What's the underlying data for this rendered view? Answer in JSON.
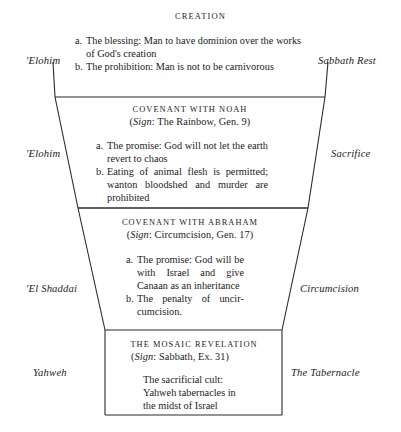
{
  "figure": {
    "title": "CREATION",
    "shape": {
      "stroke_color": "#2b2b2b",
      "description": "nested-trapezoid"
    },
    "sections": [
      {
        "id": "creation",
        "heading": "CREATION",
        "sign": null,
        "left_label": "'Elohim",
        "right_label": "Sabbath Rest",
        "items": [
          {
            "mark": "a.",
            "text": "The blessing: Man to have dominion over the works of God's creation"
          },
          {
            "mark": "b.",
            "text": "The prohibition: Man is not to be carnivorous"
          }
        ]
      },
      {
        "id": "noah",
        "heading": "COVENANT WITH NOAH",
        "sign_prefix": "Sign",
        "sign_rest": ": The Rainbow, Gen. 9)",
        "sign_open": "(",
        "sign_full": "(Sign: The Rainbow, Gen. 9)",
        "left_label": "'Elohim",
        "right_label": "Sacrifice",
        "items": [
          {
            "mark": "a.",
            "text": "The promise: God will not let the earth revert to chaos"
          },
          {
            "mark": "b.",
            "text": "Eating of animal flesh is permitted; wanton bloodshed and murder are prohibited"
          }
        ]
      },
      {
        "id": "abraham",
        "heading": "COVENANT WITH ABRAHAM",
        "sign_prefix": "Sign",
        "sign_rest": ": Circumcision, Gen. 17)",
        "sign_open": "(",
        "sign_full": "(Sign: Circumcision, Gen. 17)",
        "left_label": "'El Shaddai",
        "right_label": "Circumcision",
        "items": [
          {
            "mark": "a.",
            "text": "The promise: God will be with Israel and give Canaan as an inherit-ance"
          },
          {
            "mark": "b.",
            "text": "The penalty of uncir-cumcision."
          }
        ]
      },
      {
        "id": "mosaic",
        "heading": "THE MOSAIC REVELATION",
        "sign_prefix": "Sign",
        "sign_rest": ": Sabbath, Ex. 31)",
        "sign_open": "(",
        "sign_full": "(Sign: Sabbath, Ex. 31)",
        "left_label": "Yahweh",
        "right_label": "The Tabernacle",
        "body": "The sacrificial cult: Yahweh tabernacles in the midst of Israel"
      }
    ]
  },
  "creation_items": {
    "a_line1": "a. The blessing: Man to have dominion over",
    "a_line2": "the works of God's creation",
    "b_line1": "b. The prohibition: Man is not to be",
    "b_line2": "carnivorous"
  },
  "noah_items": {
    "a_line1": "a. The promise: God will not let",
    "a_line2": "the earth revert to chaos",
    "b_line1": "b. Eating of animal flesh is",
    "b_line2": "permitted; wanton bloodshed",
    "b_line3": "and murder are prohibited"
  },
  "abraham_items": {
    "a_line1": "a. The promise: God will",
    "a_line2": "be with Israel and give",
    "a_line3": "Canaan as an inherit-",
    "a_line4": "ance",
    "b_line1": "b. The penalty of uncir-",
    "b_line2": "cumcision."
  },
  "mosaic_body": {
    "line1": "The sacrificial cult:",
    "line2": "Yahweh tabernacles in",
    "line3": "the midst of Israel"
  }
}
